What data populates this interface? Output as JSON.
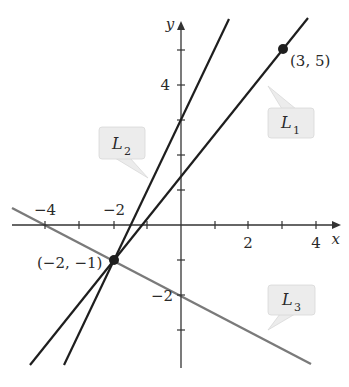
{
  "figure": {
    "axes": {
      "x_label": "x",
      "y_label": "y",
      "x_ticks": [
        -4,
        -3,
        -2,
        -1,
        1,
        2,
        3,
        4
      ],
      "x_tick_labels": [
        {
          "value": -4,
          "text": "−4"
        },
        {
          "value": -2,
          "text": "−2"
        },
        {
          "value": 2,
          "text": "2"
        },
        {
          "value": 4,
          "text": "4"
        }
      ],
      "y_ticks": [
        -3,
        -2,
        -1,
        1,
        2,
        3,
        4,
        5
      ],
      "y_tick_labels": [
        {
          "value": 4,
          "text": "4"
        },
        {
          "value": -2,
          "text": "−2"
        }
      ]
    },
    "points": [
      {
        "label": "(3, 5)",
        "x": 3,
        "y": 5
      },
      {
        "label": "(−2, −1)",
        "x": -2,
        "y": -1
      }
    ],
    "lines": [
      {
        "name": "L",
        "sub": "1",
        "color": "#1e1e1e",
        "through": [
          [
            -2,
            -1
          ],
          [
            3,
            5
          ]
        ],
        "slope": 1.2
      },
      {
        "name": "L",
        "sub": "2",
        "color": "#1e1e1e",
        "through": [
          [
            -2,
            -1
          ],
          [
            0,
            3
          ]
        ],
        "slope": 2
      },
      {
        "name": "L",
        "sub": "3",
        "color": "#7a7a7a",
        "through": [
          [
            -2,
            -1
          ],
          [
            0,
            -2
          ]
        ],
        "slope": -0.5
      }
    ],
    "callout_fill": "#ececec"
  }
}
